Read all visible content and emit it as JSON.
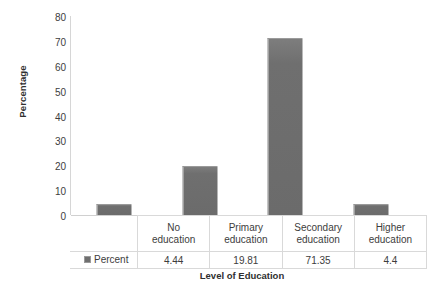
{
  "chart_data": {
    "type": "bar",
    "title": "",
    "xlabel": "Level of Education",
    "ylabel": "Percentage",
    "categories": [
      "No education",
      "Primary education",
      "Secondary education",
      "Higher education"
    ],
    "category_lines": [
      [
        "No",
        "education"
      ],
      [
        "Primary",
        "education"
      ],
      [
        "Secondary",
        "education"
      ],
      [
        "Higher",
        "education"
      ]
    ],
    "series": [
      {
        "name": "Percent",
        "values": [
          4.44,
          19.81,
          71.35,
          4.4
        ],
        "value_labels": [
          "4.44",
          "19.81",
          "71.35",
          "4.4"
        ],
        "color": "#6f6f6f"
      }
    ],
    "ylim": [
      0,
      80
    ],
    "yticks": [
      0,
      10,
      20,
      30,
      40,
      50,
      60,
      70,
      80
    ],
    "ytick_labels": [
      "0",
      "10",
      "20",
      "30",
      "40",
      "50",
      "60",
      "70",
      "80"
    ],
    "grid": false,
    "legend": "data-table",
    "legend_position": "bottom-left",
    "has_data_table": true
  },
  "legend": {
    "series_label": "Percent",
    "swatch_name": "percent-series-swatch"
  },
  "axes": {
    "y_title": "Percentage",
    "x_title": "Level of Education"
  }
}
